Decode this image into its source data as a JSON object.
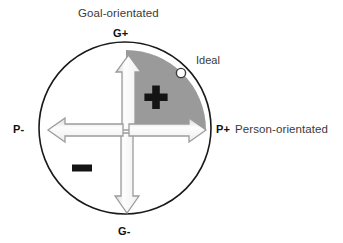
{
  "figure": {
    "kind": "quadrant-circle-diagram",
    "background_color": "#ffffff"
  },
  "axes": {
    "vertical": {
      "title": "Goal-orientated",
      "positive_pole": "G+",
      "negative_pole": "G-"
    },
    "horizontal": {
      "title": "Person-orientated",
      "positive_pole": "P+",
      "negative_pole": "P-"
    }
  },
  "annotations": {
    "ideal_label": "Ideal",
    "plus_marker": "+",
    "minus_marker": "-"
  },
  "colors": {
    "circle_outline": "#1a1a1a",
    "wedge_fill": "#9a9a9a",
    "arrow_fill": "#fbfbfb",
    "arrow_outline": "#9c9c9c",
    "marker_black": "#111111",
    "ideal_circle_fill": "#ffffff",
    "ideal_circle_outline": "#3a3a3a",
    "text": "#2b2b2b"
  },
  "geometry": {
    "circle": {
      "cx": 125,
      "cy": 128,
      "r": 86
    },
    "wedge": {
      "cx": 126,
      "cy": 130,
      "r": 80,
      "start_deg": 0,
      "end_deg": 90,
      "quadrant": "upper-right"
    },
    "ideal_point": {
      "x": 181,
      "y": 73,
      "r": 4.5
    },
    "plus_marker": {
      "x": 156,
      "y": 97,
      "size": 23,
      "thickness": 7
    },
    "minus_marker": {
      "x": 82,
      "y": 168,
      "width": 20,
      "height": 7
    },
    "arrow_up": {
      "from_y": 130,
      "to_y": 56,
      "x": 128
    },
    "arrow_down": {
      "from_y": 132,
      "to_y": 213,
      "x": 127
    },
    "arrow_right": {
      "from_x": 128,
      "to_x": 206,
      "y": 130
    },
    "arrow_left": {
      "from_x": 124,
      "to_x": 48,
      "y": 130
    }
  }
}
